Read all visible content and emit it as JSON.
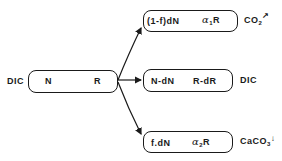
{
  "diagram": {
    "source": {
      "input_label": "DIC",
      "left_var": "N",
      "right_var": "R"
    },
    "branches": [
      {
        "name": "co2-release",
        "left_expr": "(1-f)dN",
        "right_greek": "α",
        "right_sub": "1",
        "right_var": "R",
        "output_label": "CO",
        "output_sub": "2",
        "output_arrow": "↗"
      },
      {
        "name": "dic-remaining",
        "left_expr": "N-dN",
        "right_expr": "R-dR",
        "output_label": "DIC"
      },
      {
        "name": "caco3-precipitation",
        "left_expr": "f.dN",
        "right_greek": "α",
        "right_sub": "2",
        "right_var": "R",
        "output_label": "CaCO",
        "output_sub": "3",
        "output_arrow": "↓"
      }
    ],
    "colors": {
      "line": "#1a1a1a",
      "background": "#ffffff"
    }
  }
}
